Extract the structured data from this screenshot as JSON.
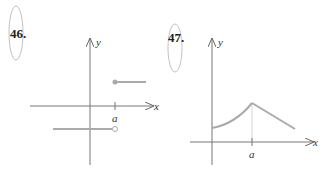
{
  "problems": [
    {
      "number": "46.",
      "x_label": "x",
      "y_label": "y",
      "tick_label": "a",
      "description": "Step function: value negative constant for x < a (open circle at a), positive constant for x >= a (closed dot at a)"
    },
    {
      "number": "47.",
      "x_label": "x",
      "y_label": "y",
      "tick_label": "a",
      "description": "Function increasing concave up from positive y-intercept to a peak at x = a, then decreasing linearly"
    }
  ],
  "colors": {
    "axis": "#777777",
    "curve": "#aaaaaa"
  }
}
